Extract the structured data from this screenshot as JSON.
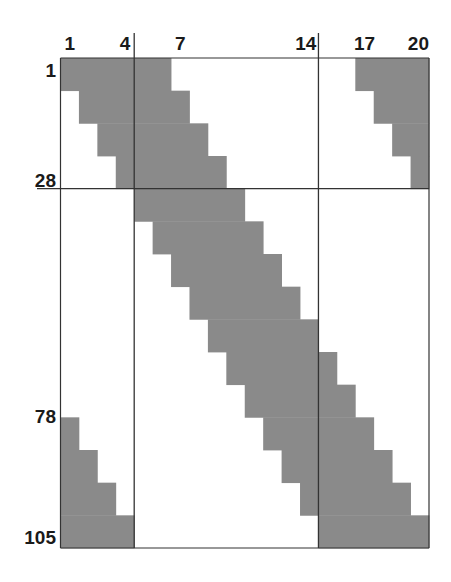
{
  "diagram": {
    "type": "block-banded-matrix-sparsity",
    "columns": 20,
    "rows": 105,
    "row_block_size": 7,
    "row_blocks": 15,
    "fill_color": "#8a8a8a",
    "line_color": "#333333",
    "column_labels": [
      {
        "text": "1",
        "col": 1
      },
      {
        "text": "4",
        "col": 4
      },
      {
        "text": "7",
        "col": 7
      },
      {
        "text": "14",
        "col": 14
      },
      {
        "text": "17",
        "col": 17
      },
      {
        "text": "20",
        "col": 20
      }
    ],
    "row_labels": [
      {
        "text": "1",
        "row": 1
      },
      {
        "text": "28",
        "row": 28
      },
      {
        "text": "78",
        "row": 78
      },
      {
        "text": "105",
        "row": 105
      }
    ],
    "divider_after_columns": [
      4,
      14
    ],
    "divider_after_rows": [
      28
    ],
    "shaded_blocks": [
      {
        "block": 1,
        "rows": "1-7",
        "cols": [
          [
            1,
            6
          ],
          [
            17,
            20
          ]
        ]
      },
      {
        "block": 2,
        "rows": "8-14",
        "cols": [
          [
            2,
            7
          ],
          [
            18,
            20
          ]
        ]
      },
      {
        "block": 3,
        "rows": "15-21",
        "cols": [
          [
            3,
            8
          ],
          [
            19,
            20
          ]
        ]
      },
      {
        "block": 4,
        "rows": "22-28",
        "cols": [
          [
            4,
            9
          ],
          [
            20,
            20
          ]
        ]
      },
      {
        "block": 5,
        "rows": "29-35",
        "cols": [
          [
            5,
            10
          ]
        ]
      },
      {
        "block": 6,
        "rows": "36-42",
        "cols": [
          [
            6,
            11
          ]
        ]
      },
      {
        "block": 7,
        "rows": "43-49",
        "cols": [
          [
            7,
            12
          ]
        ]
      },
      {
        "block": 8,
        "rows": "50-56",
        "cols": [
          [
            8,
            13
          ]
        ]
      },
      {
        "block": 9,
        "rows": "57-63",
        "cols": [
          [
            9,
            14
          ]
        ]
      },
      {
        "block": 10,
        "rows": "64-70",
        "cols": [
          [
            10,
            15
          ]
        ]
      },
      {
        "block": 11,
        "rows": "71-77",
        "cols": [
          [
            11,
            16
          ]
        ]
      },
      {
        "block": 12,
        "rows": "78-84",
        "cols": [
          [
            1,
            1
          ],
          [
            12,
            17
          ]
        ]
      },
      {
        "block": 13,
        "rows": "85-91",
        "cols": [
          [
            1,
            2
          ],
          [
            13,
            18
          ]
        ]
      },
      {
        "block": 14,
        "rows": "92-98",
        "cols": [
          [
            1,
            3
          ],
          [
            14,
            19
          ]
        ]
      },
      {
        "block": 15,
        "rows": "99-105",
        "cols": [
          [
            1,
            4
          ],
          [
            15,
            20
          ]
        ]
      }
    ]
  }
}
